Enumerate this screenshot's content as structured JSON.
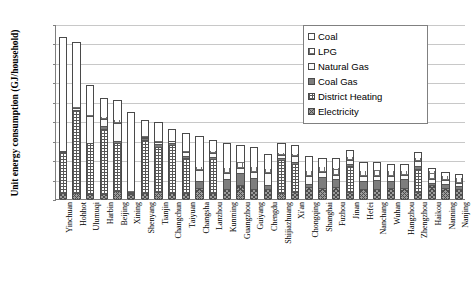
{
  "chart_data": {
    "type": "bar",
    "title": "",
    "subtitle": "",
    "stacked": true,
    "xlabel": "",
    "ylabel": "Unit energy consumption (GJ/household)",
    "ylim": [
      0,
      90
    ],
    "ytick_step": 10,
    "ytick_labels": [
      "0",
      "10",
      "20",
      "30",
      "40",
      "50",
      "60",
      "70",
      "80",
      "90"
    ],
    "grid": true,
    "legend_position": "top-right",
    "categories": [
      "Yinchuan",
      "Hohhot",
      "Ulumuqi",
      "Harbin",
      "Beijing",
      "Xining",
      "Shenyang",
      "Tianjin",
      "Changchun",
      "Taiyuan",
      "Changsha",
      "Lanzhou",
      "Kunming",
      "Guangzhou",
      "Guiyang",
      "Chengdu",
      "Shijiazhuang",
      "Xi'an",
      "Chongqing",
      "Shanghai",
      "Fuzhou",
      "Jinan",
      "Hefei",
      "Nanchang",
      "Wuhan",
      "Hangzhou",
      "Zhengzhou",
      "Haikou",
      "Nanning",
      "Nanjing"
    ],
    "series": [
      {
        "name": "Electricity",
        "pattern": "elec",
        "values": [
          3.2,
          3.0,
          2.6,
          2.5,
          4.0,
          2.4,
          3.2,
          3.6,
          3.0,
          3.1,
          5.5,
          3.3,
          5.2,
          7.0,
          5.0,
          5.2,
          3.0,
          3.4,
          6.0,
          5.8,
          6.0,
          3.4,
          5.0,
          5.2,
          5.4,
          5.6,
          3.6,
          7.0,
          5.6,
          5.2
        ]
      },
      {
        "name": "District Heating",
        "pattern": "dheat",
        "values": [
          21.0,
          43.0,
          26.0,
          33.5,
          25.0,
          0.0,
          27.0,
          23.0,
          25.0,
          18.0,
          0.0,
          17.5,
          0.0,
          0.0,
          0.0,
          0.0,
          17.0,
          14.5,
          0.0,
          0.0,
          0.0,
          13.5,
          0.0,
          0.0,
          0.0,
          0.0,
          12.0,
          0.0,
          0.0,
          0.0
        ]
      },
      {
        "name": "Coal Gas",
        "pattern": "coalgas",
        "values": [
          0.0,
          0.0,
          0.0,
          1.5,
          1.0,
          0.8,
          1.0,
          1.5,
          0.8,
          1.0,
          3.5,
          1.0,
          5.0,
          6.5,
          6.0,
          2.0,
          1.2,
          1.0,
          1.5,
          5.5,
          4.5,
          1.2,
          4.0,
          4.5,
          4.0,
          4.5,
          1.5,
          1.2,
          2.0,
          1.4
        ]
      },
      {
        "name": "Natural Gas",
        "pattern": "ngas",
        "values": [
          0.6,
          0.8,
          14.0,
          3.5,
          9.0,
          0.6,
          0.8,
          1.0,
          0.8,
          2.0,
          6.0,
          2.0,
          3.0,
          2.5,
          3.0,
          6.0,
          1.5,
          3.0,
          4.5,
          2.5,
          2.0,
          2.0,
          3.0,
          2.0,
          2.5,
          2.0,
          2.5,
          2.0,
          2.0,
          1.8
        ]
      },
      {
        "name": "LPG",
        "pattern": "lpg",
        "values": [
          0.6,
          0.8,
          0.9,
          1.5,
          2.0,
          1.0,
          1.0,
          1.2,
          1.0,
          1.2,
          2.0,
          1.5,
          3.5,
          3.5,
          3.0,
          2.5,
          1.5,
          2.0,
          3.0,
          3.0,
          4.0,
          2.0,
          3.0,
          3.5,
          3.0,
          3.0,
          2.0,
          4.5,
          3.0,
          3.0
        ]
      },
      {
        "name": "Coal",
        "pattern": "coal",
        "values": [
          58.1,
          33.4,
          15.0,
          9.5,
          10.0,
          40.2,
          7.5,
          9.2,
          5.4,
          8.7,
          15.5,
          5.2,
          12.3,
          8.5,
          9.5,
          7.3,
          4.8,
          4.1,
          7.0,
          4.2,
          4.5,
          2.9,
          4.0,
          3.8,
          3.1,
          2.9,
          2.4,
          1.3,
          1.4,
          1.6
        ]
      }
    ],
    "totals": [
      83.5,
      81.0,
      58.5,
      52.0,
      51.0,
      45.0,
      40.5,
      39.5,
      36.0,
      34.0,
      32.5,
      30.5,
      29.0,
      28.0,
      26.5,
      23.0,
      29.0,
      28.0,
      22.0,
      21.0,
      21.0,
      25.0,
      19.0,
      19.0,
      18.0,
      18.0,
      24.0,
      16.0,
      14.0,
      13.0
    ]
  },
  "legend": {
    "items": [
      {
        "label": "Coal",
        "pattern": "coal"
      },
      {
        "label": "LPG",
        "pattern": "lpg"
      },
      {
        "label": "Natural Gas",
        "pattern": "ngas"
      },
      {
        "label": "Coal Gas",
        "pattern": "coalgas"
      },
      {
        "label": "District Heating",
        "pattern": "dheat"
      },
      {
        "label": "Electricity",
        "pattern": "elec"
      }
    ]
  }
}
